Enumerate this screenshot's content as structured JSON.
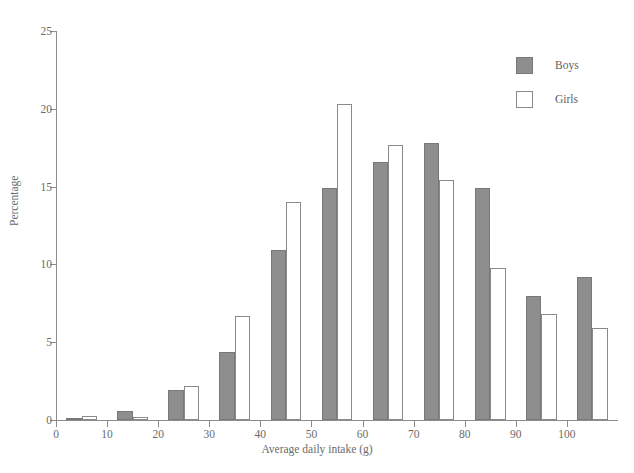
{
  "figure": {
    "cropped_title_fragment": "",
    "background_color": "#ffffff"
  },
  "legend": {
    "position": "top-right",
    "entries": [
      {
        "label": "Boys",
        "color": "#8e8e8e",
        "style": "filled"
      },
      {
        "label": "Girls",
        "color": "#ffffff",
        "style": "outline"
      }
    ]
  },
  "chart_data": {
    "type": "bar",
    "title": "",
    "xlabel": "Average daily intake (g)",
    "ylabel": "Percentage",
    "xlim": [
      0,
      110
    ],
    "ylim": [
      0,
      25
    ],
    "xticks": [
      0,
      10,
      20,
      30,
      40,
      50,
      60,
      70,
      80,
      90,
      100
    ],
    "yticks": [
      0,
      5,
      10,
      15,
      20,
      25
    ],
    "grid": false,
    "bin_width": 10,
    "categories": [
      "5",
      "15",
      "25",
      "35",
      "45",
      "55",
      "65",
      "75",
      "85",
      "95",
      "105"
    ],
    "bin_ranges": [
      "0-10",
      "10-20",
      "20-30",
      "30-40",
      "40-50",
      "50-60",
      "60-70",
      "70-80",
      "80-90",
      "90-100",
      "100-110"
    ],
    "series": [
      {
        "name": "Boys",
        "color": "#8e8e8e",
        "values": [
          0.15,
          0.6,
          1.9,
          4.4,
          10.9,
          14.9,
          16.6,
          17.8,
          14.9,
          8.0,
          9.2
        ]
      },
      {
        "name": "Girls",
        "color": "#ffffff",
        "values": [
          0.25,
          0.2,
          2.2,
          6.7,
          14.0,
          20.3,
          17.7,
          15.4,
          9.8,
          6.8,
          5.9
        ]
      }
    ]
  }
}
